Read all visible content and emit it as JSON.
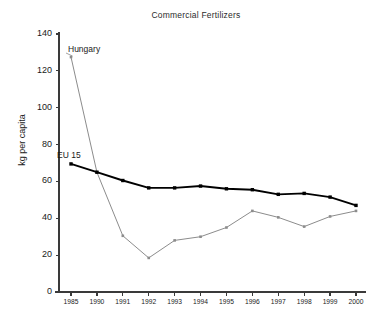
{
  "chart_data": {
    "type": "line",
    "title": "Commercial Fertilizers",
    "xlabel": "",
    "ylabel": "kg per capita",
    "categories": [
      "1985",
      "1990",
      "1991",
      "1992",
      "1993",
      "1994",
      "1995",
      "1996",
      "1997",
      "1998",
      "1999",
      "2000"
    ],
    "ylim": [
      0,
      140
    ],
    "yticks": [
      0,
      20,
      40,
      60,
      80,
      100,
      120,
      140
    ],
    "ytick_labels": [
      "0",
      "20",
      "40",
      "60",
      "80",
      "100",
      "120",
      "140"
    ],
    "grid": false,
    "legend_position": "inline-annotations",
    "series": [
      {
        "name": "Hungary",
        "color": "#8c8c8c",
        "marker": "square",
        "values": [
          127.5,
          65.0,
          30.5,
          18.5,
          28.0,
          30.0,
          35.0,
          44.0,
          40.5,
          35.5,
          41.0,
          44.0
        ]
      },
      {
        "name": "EU 15",
        "color": "#000000",
        "marker": "square",
        "values": [
          69.5,
          65.0,
          60.5,
          56.5,
          56.5,
          57.5,
          56.0,
          55.5,
          53.0,
          53.5,
          51.5,
          47.0
        ]
      }
    ],
    "annotations": [
      {
        "text": "Hungary",
        "series": "Hungary"
      },
      {
        "text": "EU 15",
        "series": "EU 15"
      }
    ]
  },
  "axis": {
    "axis_color": "#3a3a3a"
  }
}
